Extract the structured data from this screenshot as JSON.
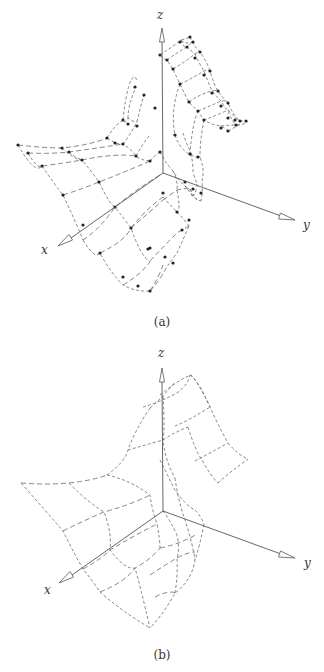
{
  "figure": {
    "panels": [
      {
        "id": "a",
        "caption": "(a)",
        "description": "3D surface mesh with control points (dots at grid nodes), dashed grid lines",
        "axes": {
          "x_label": "x",
          "y_label": "y",
          "z_label": "z"
        },
        "show_points": true
      },
      {
        "id": "b",
        "caption": "(b)",
        "description": "Same 3D surface drawn as coarser dashed mesh without control points",
        "axes": {
          "x_label": "x",
          "y_label": "y",
          "z_label": "z"
        },
        "show_points": false
      }
    ]
  },
  "colors": {
    "line": "#666666",
    "axis": "#555555",
    "point": "#222222",
    "background": "#ffffff"
  }
}
